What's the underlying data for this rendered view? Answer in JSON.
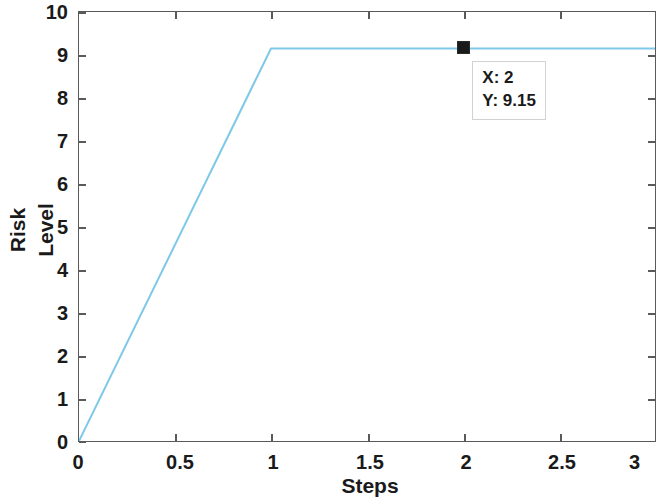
{
  "figure": {
    "background_color": "#ffffff",
    "axes_color": "#5a5a5a",
    "line_color": "#7ec8e8",
    "marker_color": "#1a1a1a"
  },
  "axis": {
    "ylabel_line1": "Risk",
    "ylabel_line2": "Level",
    "xlabel": "Steps",
    "ytick_labels": [
      "0",
      "1",
      "2",
      "3",
      "4",
      "5",
      "6",
      "7",
      "8",
      "9",
      "10"
    ],
    "xtick_labels": [
      "0",
      "0.5",
      "1",
      "1.5",
      "2",
      "2.5",
      "3"
    ]
  },
  "datatip": {
    "x_row": "X: 2",
    "y_row": "Y: 9.15",
    "marker_name": "square-marker"
  },
  "chart_data": {
    "type": "line",
    "title": "",
    "subtitle": "",
    "xlabel": "Steps",
    "ylabel": "Risk Level",
    "xlim": [
      0,
      3
    ],
    "ylim": [
      0,
      10
    ],
    "xticks": [
      0,
      0.5,
      1,
      1.5,
      2,
      2.5,
      3
    ],
    "yticks": [
      0,
      1,
      2,
      3,
      4,
      5,
      6,
      7,
      8,
      9,
      10
    ],
    "grid": false,
    "legend": null,
    "legend_position": "none",
    "series": [
      {
        "name": "Risk Level",
        "color": "#7ec8e8",
        "linewidth": 2,
        "x": [
          0,
          1,
          3
        ],
        "y": [
          0,
          9.15,
          9.15
        ]
      }
    ],
    "annotations": [
      {
        "type": "datatip",
        "text": "X: 2\nY: 9.15",
        "x": 2,
        "y": 9.15,
        "marker": "square",
        "marker_color": "#1a1a1a"
      }
    ]
  }
}
